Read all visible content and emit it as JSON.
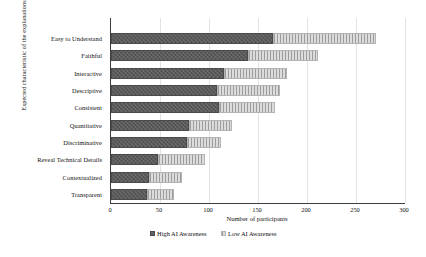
{
  "chart_data": {
    "type": "bar",
    "orientation": "horizontal",
    "stacked": true,
    "title": "",
    "xlabel": "Number of participants",
    "ylabel": "Expected characteristic of the explanations",
    "xlim": [
      0,
      300
    ],
    "xticks": [
      0,
      50,
      100,
      150,
      200,
      250,
      300
    ],
    "grid": true,
    "legend_position": "bottom",
    "categories": [
      "Easy to Understand",
      "Faithful",
      "Interactive",
      "Descriptive",
      "Consistent",
      "Quantitative",
      "Discriminative",
      "Reveal Technical Details",
      "Contextualized",
      "Transparent"
    ],
    "series": [
      {
        "name": "High AI Awareness",
        "color": "#595959",
        "values": [
          165,
          140,
          115,
          108,
          110,
          80,
          78,
          48,
          39,
          37
        ]
      },
      {
        "name": "Low AI Awareness",
        "color": "#c9c9c9",
        "values": [
          105,
          71,
          65,
          64,
          57,
          43,
          34,
          48,
          33,
          27
        ]
      }
    ],
    "totals": [
      270,
      211,
      180,
      172,
      167,
      123,
      112,
      96,
      72,
      64
    ]
  },
  "axes": {
    "y_title": "Expected characteristic of the explanations",
    "x_title": "Number of participants",
    "x_tick_labels": [
      "0",
      "50",
      "100",
      "150",
      "200",
      "250",
      "300"
    ]
  },
  "legend": {
    "items": [
      {
        "label": "High AI Awareness"
      },
      {
        "label": "Low AI Awareness"
      }
    ]
  }
}
